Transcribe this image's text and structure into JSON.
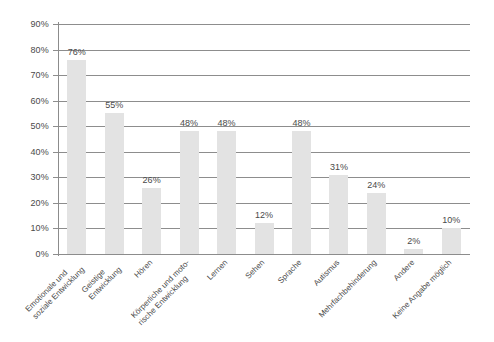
{
  "chart_data": {
    "type": "bar",
    "title": "",
    "subtitle": "",
    "xlabel": "",
    "ylabel": "",
    "ylim": [
      0,
      90
    ],
    "y_tick_step": 10,
    "grid": true,
    "legend": false,
    "legend_position": "none",
    "orientation": "vertical",
    "value_label_suffix": "%",
    "categories": [
      "Emotionale und\nsoziale Entwicklung",
      "Geistige\nEntwicklung",
      "Hören",
      "Körperliche und moto-\nrische Entwicklung",
      "Lernen",
      "Sehen",
      "Sprache",
      "Autismus",
      "Mehrfachbehinderung",
      "Andere",
      "Keine Angabe möglich"
    ],
    "values": [
      76,
      55,
      26,
      48,
      48,
      12,
      48,
      31,
      24,
      2,
      10
    ],
    "value_labels": [
      "76%",
      "55%",
      "26%",
      "48%",
      "48%",
      "12%",
      "48%",
      "31%",
      "24%",
      "2%",
      "10%"
    ],
    "y_tick_labels": [
      "0%",
      "10%",
      "20%",
      "30%",
      "40%",
      "50%",
      "60%",
      "70%",
      "80%",
      "90%"
    ],
    "y_tick_values": [
      0,
      10,
      20,
      30,
      40,
      50,
      60,
      70,
      80,
      90
    ],
    "colors": {
      "bar_fill": "#e3e3e3",
      "gridline": "#8d8d8d",
      "axis": "#8c8c8c",
      "text": "#4a4a4a",
      "background": "#ffffff"
    }
  }
}
